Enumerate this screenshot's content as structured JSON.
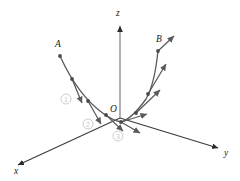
{
  "figure": {
    "background_color": "#ffffff",
    "axis_color": "#3a3a3a",
    "curve_color": "#5a5a5a",
    "vector_color": "#5a5a5a",
    "dot_color": "#4a4a4a",
    "label_color": "#1a1a1a",
    "annotation_color": "#cccccc"
  },
  "axes": [
    {
      "id": "x",
      "label": "x",
      "label_x": 14,
      "label_y": 174,
      "start_x": 120,
      "start_y": 118,
      "end_x": 18,
      "end_y": 165,
      "direction": "lower-left"
    },
    {
      "id": "y",
      "label": "y",
      "label_x": 224,
      "label_y": 156,
      "start_x": 120,
      "start_y": 118,
      "end_x": 218,
      "end_y": 148,
      "direction": "lower-right"
    },
    {
      "id": "z",
      "label": "z",
      "label_x": 116,
      "label_y": 16,
      "start_x": 120,
      "start_y": 118,
      "end_x": 120,
      "end_y": 26,
      "direction": "up"
    }
  ],
  "origin": {
    "label": "O",
    "label_x": 110,
    "label_y": 112,
    "x": 120,
    "y": 118
  },
  "points": [
    {
      "label": "A",
      "label_x": 55,
      "label_y": 47,
      "x": 60,
      "y": 56
    },
    {
      "label": "B",
      "label_x": 156,
      "label_y": 42,
      "x": 158,
      "y": 51
    }
  ],
  "curve": {
    "type": "parabola-like",
    "left_branch": "M60,56 C70,78 84,100 104,114 C111,119 116,121 121,122",
    "right_branch": "M121,122 C128,120 136,113 146,99 C152,89 156,70 158,51",
    "stroke_width": 1.3
  },
  "curve_dots": [
    {
      "x": 60,
      "y": 56
    },
    {
      "x": 72,
      "y": 79
    },
    {
      "x": 88,
      "y": 101
    },
    {
      "x": 106,
      "y": 115
    },
    {
      "x": 121,
      "y": 122
    },
    {
      "x": 136,
      "y": 113
    },
    {
      "x": 148,
      "y": 94
    },
    {
      "x": 158,
      "y": 51
    }
  ],
  "vectors": [
    {
      "id": "left-1",
      "from_x": 72,
      "from_y": 79,
      "to_x": 82,
      "to_y": 103
    },
    {
      "id": "left-2",
      "from_x": 88,
      "from_y": 101,
      "to_x": 101,
      "to_y": 124
    },
    {
      "id": "left-3",
      "from_x": 106,
      "from_y": 115,
      "to_x": 123,
      "to_y": 131
    },
    {
      "id": "left-4",
      "from_x": 121,
      "from_y": 122,
      "to_x": 140,
      "to_y": 133
    },
    {
      "id": "right-1",
      "from_x": 121,
      "from_y": 122,
      "to_x": 147,
      "to_y": 114
    },
    {
      "id": "right-2",
      "from_x": 136,
      "from_y": 113,
      "to_x": 160,
      "to_y": 90
    },
    {
      "id": "right-3",
      "from_x": 148,
      "from_y": 94,
      "to_x": 166,
      "to_y": 64
    },
    {
      "id": "right-4",
      "from_x": 158,
      "from_y": 51,
      "to_x": 174,
      "to_y": 36
    }
  ],
  "step_annotations": [
    {
      "label": "1",
      "cx": 66,
      "cy": 99,
      "r": 5
    },
    {
      "label": "2",
      "cx": 88,
      "cy": 124,
      "r": 5
    },
    {
      "label": "3",
      "cx": 118,
      "cy": 136,
      "r": 5
    }
  ]
}
